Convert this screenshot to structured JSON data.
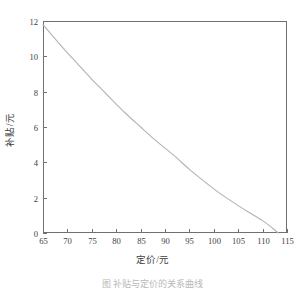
{
  "figure": {
    "caption": "图  补贴与定价的关系曲线"
  },
  "chart_data": {
    "type": "line",
    "title": "",
    "xlabel": "定价/元",
    "ylabel": "补贴/元",
    "xlim": [
      65,
      115
    ],
    "ylim": [
      0,
      12
    ],
    "xticks": [
      65,
      70,
      75,
      80,
      85,
      90,
      95,
      100,
      105,
      110,
      115
    ],
    "yticks": [
      0,
      2,
      4,
      6,
      8,
      10,
      12
    ],
    "grid": false,
    "legend": false,
    "line_color": "#b3b3b3",
    "frame_color": "#707070",
    "series": [
      {
        "name": "补贴",
        "x": [
          65,
          67,
          70,
          72,
          75,
          77,
          80,
          82,
          85,
          87,
          90,
          92,
          95,
          97,
          100,
          102,
          105,
          107,
          110,
          112,
          113.2
        ],
        "values": [
          11.8,
          11.15,
          10.2,
          9.6,
          8.7,
          8.15,
          7.3,
          6.75,
          6.0,
          5.5,
          4.8,
          4.35,
          3.6,
          3.15,
          2.5,
          2.1,
          1.55,
          1.2,
          0.7,
          0.28,
          0.0
        ]
      }
    ]
  },
  "axis_geometry": {
    "left": 43,
    "right": 287,
    "top": 21,
    "bottom": 233
  }
}
